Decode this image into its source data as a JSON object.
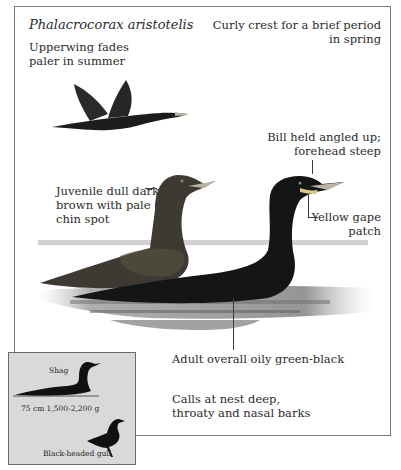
{
  "plate": {
    "species_name": "Phalacrocorax aristotelis",
    "annotations": {
      "upperwing": [
        "Upperwing fades",
        "paler in summer"
      ],
      "crest": [
        "Curly crest for a brief period",
        "in spring"
      ],
      "bill": [
        "Bill held angled up;",
        "forehead steep"
      ],
      "juvenile": [
        "Juvenile dull dark",
        "brown with pale",
        "chin spot"
      ],
      "gape": [
        "Yellow gape",
        "patch"
      ],
      "adult": "Adult overall oily green-black",
      "calls": [
        "Calls at nest deep,",
        "throaty and nasal barks"
      ]
    },
    "illustrations": [
      "flying-shag",
      "juvenile-shag-swimming",
      "adult-shag-swimming"
    ]
  },
  "size_comparison": {
    "subject_label": "Shag",
    "measurements": "75 cm 1,500-2,200 g",
    "reference_label": "Black-headed gull"
  },
  "colors": {
    "frame_border": "#7a7a7a",
    "adult_plumage": "#141616",
    "juvenile_plumage": "#3e3a33",
    "bill": "#b9b4a6",
    "gape": "#d8c98a",
    "water": "#8c8c8c",
    "inset_background": "#d9d9d9"
  }
}
